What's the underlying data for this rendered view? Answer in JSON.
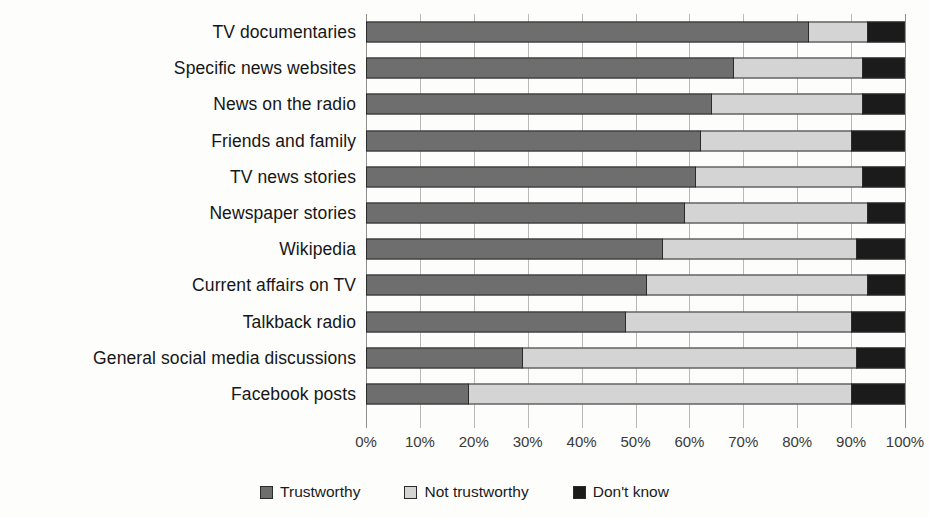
{
  "chart_data": {
    "type": "bar",
    "subtype": "stacked-horizontal-100pct",
    "title": "",
    "xlabel": "",
    "ylabel": "",
    "xlim": [
      0,
      100
    ],
    "xticks": [
      "0%",
      "10%",
      "20%",
      "30%",
      "40%",
      "50%",
      "60%",
      "70%",
      "80%",
      "90%",
      "100%"
    ],
    "grid": true,
    "legend_position": "bottom",
    "categories": [
      "TV documentaries",
      "Specific news websites",
      "News on the radio",
      "Friends and family",
      "TV news stories",
      "Newspaper stories",
      "Wikipedia",
      "Current affairs on TV",
      "Talkback radio",
      "General social media discussions",
      "Facebook posts"
    ],
    "series": [
      {
        "name": "Trustworthy",
        "color": "#6e6e6e",
        "values": [
          82,
          68,
          64,
          62,
          61,
          59,
          55,
          52,
          48,
          29,
          19
        ]
      },
      {
        "name": "Not trustworthy",
        "color": "#d4d4d4",
        "values": [
          11,
          24,
          28,
          28,
          31,
          34,
          36,
          41,
          42,
          62,
          71
        ]
      },
      {
        "name": "Don't know",
        "color": "#1b1b1b",
        "values": [
          7,
          8,
          8,
          10,
          8,
          7,
          9,
          7,
          10,
          9,
          10
        ]
      }
    ]
  },
  "legend": {
    "items": [
      {
        "label": "Trustworthy"
      },
      {
        "label": "Not trustworthy"
      },
      {
        "label": "Don't know"
      }
    ]
  }
}
